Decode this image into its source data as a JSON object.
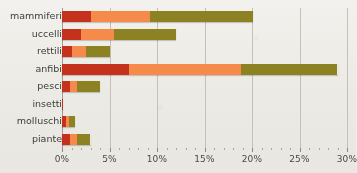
{
  "chart_data": {
    "type": "bar",
    "orientation": "horizontal",
    "stacked": true,
    "title": "",
    "xlabel": "",
    "ylabel": "",
    "xlim": [
      0,
      30
    ],
    "grid": true,
    "legend": null,
    "x_ticks": [
      0,
      5,
      10,
      15,
      20,
      25,
      30
    ],
    "x_tick_labels": [
      "0%",
      "5%",
      "10%",
      "15%",
      "20%",
      "25%",
      "30%"
    ],
    "categories": [
      "mammiferi",
      "uccelli",
      "rettili",
      "anfibi",
      "pesci",
      "insetti",
      "molluschi",
      "piante"
    ],
    "series": [
      {
        "name": "serie-1",
        "color": "#c4321d",
        "values": [
          3.0,
          2.0,
          1.0,
          7.0,
          0.8,
          0.1,
          0.4,
          0.8
        ]
      },
      {
        "name": "serie-2",
        "color": "#f58a4b",
        "values": [
          6.3,
          3.5,
          1.5,
          11.8,
          0.8,
          0.0,
          0.3,
          0.8
        ]
      },
      {
        "name": "serie-3",
        "color": "#8c8224",
        "values": [
          10.8,
          6.5,
          2.5,
          10.2,
          2.4,
          0.0,
          0.7,
          1.4
        ]
      }
    ],
    "totals": [
      20.1,
      12.0,
      5.0,
      29.0,
      4.0,
      0.1,
      1.4,
      3.0
    ],
    "colors": {
      "segment_1": "#c4321d",
      "segment_2": "#f58a4b",
      "segment_3": "#8c8224",
      "background": "#efeeea",
      "gridline": "#c3c1ba",
      "axis": "#9f9d96",
      "text": "#3d3d39"
    }
  },
  "top_strip": {
    "text": ""
  }
}
